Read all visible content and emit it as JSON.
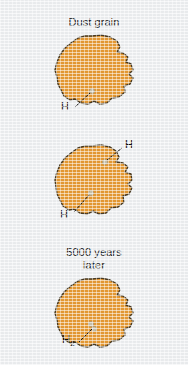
{
  "figure": {
    "caption_type": "scientific-diagram",
    "background_color": "#eef0f2",
    "width": 188,
    "height": 365
  },
  "palette": {
    "grain_fill": "#e79a33",
    "grain_outline": "#4a3b22",
    "atom_dot": "#c9c2ad",
    "leader_line": "#1a1a1a",
    "text": "#1c1c1c"
  },
  "panels": [
    {
      "id": "panel-1",
      "title": "Dust grain",
      "has_title": true,
      "atom_labels": [
        {
          "id": "panel-1-label-h",
          "symbol": "H",
          "subscript": ""
        }
      ],
      "atom_count": 1
    },
    {
      "id": "panel-2",
      "title": "",
      "has_title": false,
      "atom_labels": [
        {
          "id": "panel-2-label-h-upper",
          "symbol": "H",
          "subscript": ""
        },
        {
          "id": "panel-2-label-h-lower",
          "symbol": "H",
          "subscript": ""
        }
      ],
      "atom_count": 2
    },
    {
      "id": "panel-3",
      "title": "5000 years\nlater",
      "has_title": true,
      "atom_labels": [
        {
          "id": "panel-3-label-h2",
          "symbol": "H",
          "subscript": "2"
        }
      ],
      "atom_count": 1
    }
  ]
}
